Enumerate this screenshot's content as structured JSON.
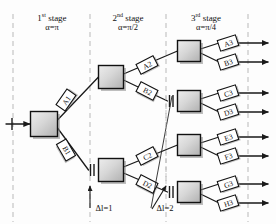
{
  "diagram": {
    "colors": {
      "line": "#1a1a1a",
      "dashed_guide": "#b9b9b9",
      "node_fill_light": "#e8e8e8",
      "node_fill_dark": "#b4b4b4",
      "node_border": "#111111",
      "shadow": "#8a8a8a",
      "label_fill": "#ffffff",
      "text": "#111111"
    },
    "stages": [
      {
        "id": "stage-1",
        "ordinal": "1",
        "suffix": "st",
        "word": "stage",
        "alpha": "α=π",
        "x": 52
      },
      {
        "id": "stage-2",
        "ordinal": "2",
        "suffix": "nd",
        "word": "stage",
        "alpha": "α=π/2",
        "x": 128
      },
      {
        "id": "stage-3",
        "ordinal": "3",
        "suffix": "rd",
        "word": "stage",
        "alpha": "α=π/4",
        "x": 206
      }
    ],
    "guides_x": [
      13,
      90,
      166,
      248
    ],
    "nodes": [
      {
        "id": "n1",
        "stage": 1,
        "cx": 44,
        "cy": 124,
        "w": 27,
        "h": 25,
        "tick": false
      },
      {
        "id": "n2a",
        "stage": 2,
        "cx": 111,
        "cy": 77,
        "w": 25,
        "h": 23,
        "tick": false
      },
      {
        "id": "n2b",
        "stage": 2,
        "cx": 111,
        "cy": 170,
        "w": 25,
        "h": 23,
        "tick": true
      },
      {
        "id": "n3a",
        "stage": 3,
        "cx": 189,
        "cy": 51,
        "w": 23,
        "h": 21,
        "tick": false
      },
      {
        "id": "n3b",
        "stage": 3,
        "cx": 189,
        "cy": 101,
        "w": 23,
        "h": 21,
        "tick": true
      },
      {
        "id": "n3c",
        "stage": 3,
        "cx": 189,
        "cy": 145,
        "w": 23,
        "h": 21,
        "tick": false
      },
      {
        "id": "n3d",
        "stage": 3,
        "cx": 189,
        "cy": 192,
        "w": 23,
        "h": 21,
        "tick": true
      }
    ],
    "path_labels": [
      {
        "id": "A1",
        "text": "A1",
        "cx": 66,
        "cy": 100,
        "angle": -55,
        "w": 19,
        "h": 11
      },
      {
        "id": "B1",
        "text": "B1",
        "cx": 66,
        "cy": 150,
        "angle": 60,
        "w": 19,
        "h": 11
      },
      {
        "id": "A2",
        "text": "A2",
        "cx": 147,
        "cy": 65,
        "angle": -27,
        "w": 19,
        "h": 11
      },
      {
        "id": "B2",
        "text": "B2",
        "cx": 147,
        "cy": 91,
        "angle": 27,
        "w": 19,
        "h": 11
      },
      {
        "id": "C2",
        "text": "C2",
        "cx": 147,
        "cy": 156,
        "angle": -27,
        "w": 19,
        "h": 11
      },
      {
        "id": "D2",
        "text": "D2",
        "cx": 147,
        "cy": 184,
        "angle": 27,
        "w": 19,
        "h": 11
      },
      {
        "id": "A3",
        "text": "A3",
        "cx": 228,
        "cy": 43,
        "angle": -18,
        "w": 19,
        "h": 11
      },
      {
        "id": "B3",
        "text": "B3",
        "cx": 228,
        "cy": 62,
        "angle": -18,
        "w": 19,
        "h": 11
      },
      {
        "id": "C3",
        "text": "C3",
        "cx": 228,
        "cy": 93,
        "angle": -18,
        "w": 19,
        "h": 11
      },
      {
        "id": "D3",
        "text": "D3",
        "cx": 228,
        "cy": 112,
        "angle": -18,
        "w": 19,
        "h": 11
      },
      {
        "id": "E3",
        "text": "E3",
        "cx": 228,
        "cy": 137,
        "angle": -18,
        "w": 19,
        "h": 11
      },
      {
        "id": "F3",
        "text": "F3",
        "cx": 228,
        "cy": 156,
        "angle": -18,
        "w": 19,
        "h": 11
      },
      {
        "id": "G3",
        "text": "G3",
        "cx": 228,
        "cy": 184,
        "angle": -18,
        "w": 19,
        "h": 11
      },
      {
        "id": "H3",
        "text": "H3",
        "cx": 228,
        "cy": 203,
        "angle": -18,
        "w": 19,
        "h": 11
      }
    ],
    "annotations": [
      {
        "id": "dl1",
        "text": "Δl=1",
        "x": 104,
        "y": 212,
        "arrow_from": [
          90,
          208
        ],
        "arrow_to": [
          90,
          186
        ]
      },
      {
        "id": "dl2",
        "text": "Δl=2",
        "x": 165,
        "y": 212,
        "arrow_from": [
          152,
          209
        ],
        "arrow_to": [
          166,
          186
        ]
      }
    ],
    "annotation_labels": {
      "dl1": "Δl=1",
      "dl2": "Δl=2"
    },
    "input_arrow": {
      "label": "input",
      "x1": 6,
      "y1": 124,
      "x2": 29,
      "y2": 124
    },
    "output_count": 8
  }
}
